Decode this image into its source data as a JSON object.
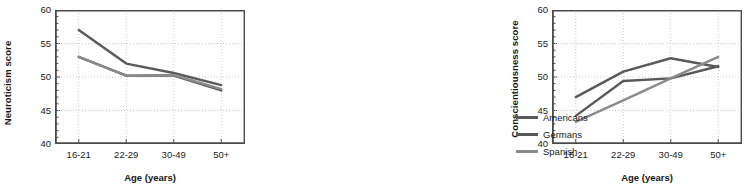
{
  "chart_data": [
    {
      "type": "line",
      "panel": "left",
      "title": "",
      "xlabel": "Age (years)",
      "ylabel": "Neuroticism score",
      "categories": [
        "16-21",
        "22-29",
        "30-49",
        "50+"
      ],
      "ylim": [
        40,
        60
      ],
      "yticks": [
        40,
        45,
        50,
        55,
        60
      ],
      "ytick_labels": [
        "40",
        "45",
        "50",
        "55",
        "60"
      ],
      "minor_tick_step": 1,
      "grid": "dotted",
      "legend_position": "right-outside",
      "series": [
        {
          "name": "Americans",
          "values": [
            57.0,
            52.0,
            50.6,
            48.8
          ],
          "color": "#5a5a5a"
        },
        {
          "name": "Germans",
          "values": [
            53.0,
            50.2,
            50.2,
            48.0
          ],
          "color": "#585858"
        },
        {
          "name": "Spanish",
          "values": [
            53.0,
            50.2,
            50.3,
            48.2
          ],
          "color": "#8a8a8a"
        }
      ]
    },
    {
      "type": "line",
      "panel": "right",
      "title": "",
      "xlabel": "Age (years)",
      "ylabel": "Conscientiousness score",
      "categories": [
        "16-21",
        "22-29",
        "30-49",
        "50+"
      ],
      "ylim": [
        40,
        60
      ],
      "yticks": [
        40,
        45,
        50,
        55,
        60
      ],
      "ytick_labels": [
        "40",
        "45",
        "50",
        "55",
        "60"
      ],
      "minor_tick_step": 1,
      "grid": "dotted",
      "legend_position": "right-outside",
      "series": [
        {
          "name": "Americans",
          "values": [
            47.0,
            50.8,
            52.8,
            51.5
          ],
          "color": "#5a5a5a"
        },
        {
          "name": "Germans",
          "values": [
            44.2,
            49.4,
            49.8,
            51.6
          ],
          "color": "#585858"
        },
        {
          "name": "Spanish",
          "values": [
            43.3,
            46.5,
            49.8,
            53.0
          ],
          "color": "#8a8a8a"
        }
      ]
    }
  ],
  "legend": {
    "items": [
      {
        "label": "Americans",
        "color": "#5a5a5a"
      },
      {
        "label": "Germans",
        "color": "#585858"
      },
      {
        "label": "Spanish",
        "color": "#8a8a8a"
      }
    ]
  },
  "axis_colors": {
    "frame": "#4a4a4a",
    "grid": "#b8b8b8",
    "text": "#1a1a1a"
  }
}
